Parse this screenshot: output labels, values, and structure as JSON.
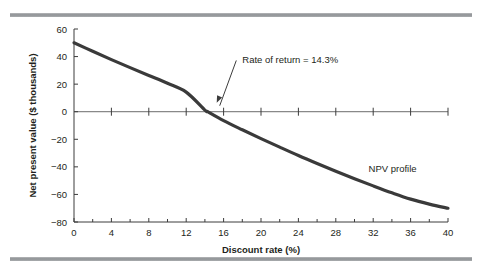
{
  "figure": {
    "name": "npv-profile-figure",
    "top_rule_color": "#8f9295",
    "bottom_rule_color": "#8f9295",
    "background": "#ffffff"
  },
  "chart_data": {
    "type": "line",
    "title": "",
    "subtitle": "",
    "xlabel": "Discount rate (%)",
    "ylabel": "Net present value ($ thousands)",
    "xlim": [
      0,
      40
    ],
    "ylim": [
      -80,
      60
    ],
    "xticks": [
      0,
      4,
      8,
      12,
      16,
      20,
      24,
      28,
      32,
      36,
      40
    ],
    "xticklabels": [
      "0",
      "4",
      "8",
      "12",
      "16",
      "20",
      "24",
      "28",
      "32",
      "36",
      "40"
    ],
    "xminor_step": 2,
    "yticks": [
      -80,
      -60,
      -40,
      -20,
      0,
      20,
      40,
      60
    ],
    "yticklabels": [
      "−80",
      "−60",
      "−40",
      "−20",
      "0",
      "20",
      "40",
      "60"
    ],
    "grid": false,
    "legend_position": "inline-label",
    "series": [
      {
        "name": "NPV profile",
        "color": "#3a3a3a",
        "x": [
          0,
          2,
          4,
          6,
          8,
          10,
          12,
          14,
          14.3,
          16,
          18,
          20,
          22,
          24,
          26,
          28,
          30,
          32,
          34,
          36,
          38,
          40
        ],
        "values": [
          50.0,
          43.8,
          37.8,
          32.0,
          26.3,
          20.6,
          14.2,
          1.2,
          0.0,
          -6.5,
          -13.1,
          -19.5,
          -25.7,
          -31.8,
          -37.6,
          -43.2,
          -48.6,
          -53.8,
          -58.8,
          -63.4,
          -67.0,
          -70.0
        ]
      }
    ],
    "annotations": [
      {
        "name": "rate-of-return-annotation",
        "text": "Rate of return = 14.3%",
        "point_x": 14.3,
        "point_y": 0,
        "text_x": 18.0,
        "text_y": 35
      },
      {
        "name": "npv-profile-label",
        "text": "NPV profile",
        "text_x": 31.5,
        "text_y": -44
      }
    ]
  }
}
